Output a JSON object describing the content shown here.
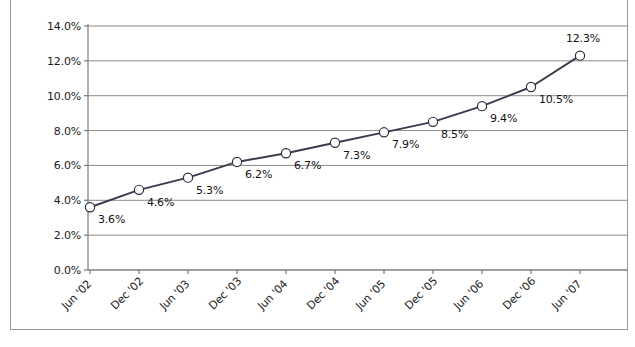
{
  "chart_data": {
    "type": "line",
    "title": "",
    "subtitle": "",
    "xlabel": "",
    "ylabel": "",
    "grid": true,
    "legend": "none",
    "ylim": [
      0.0,
      14.0
    ],
    "ytick_format": "percent",
    "yticks": [
      "0.0%",
      "2.0%",
      "4.0%",
      "6.0%",
      "8.0%",
      "10.0%",
      "12.0%",
      "14.0%"
    ],
    "ytick_values": [
      0.0,
      2.0,
      4.0,
      6.0,
      8.0,
      10.0,
      12.0,
      14.0
    ],
    "categories": [
      "Jun '02",
      "Dec '02",
      "Jun '03",
      "Dec '03",
      "Jun '04",
      "Dec '04",
      "Jun '05",
      "Dec '05",
      "Jun '06",
      "Dec '06",
      "Jun '07"
    ],
    "values": [
      3.6,
      4.6,
      5.3,
      6.2,
      6.7,
      7.3,
      7.9,
      8.5,
      9.4,
      10.5,
      12.3
    ],
    "point_labels": [
      "3.6%",
      "4.6%",
      "5.3%",
      "6.2%",
      "6.7%",
      "7.3%",
      "7.9%",
      "8.5%",
      "9.4%",
      "10.5%",
      "12.3%"
    ],
    "series": [
      {
        "name": "",
        "values": [
          3.6,
          4.6,
          5.3,
          6.2,
          6.7,
          7.3,
          7.9,
          8.5,
          9.4,
          10.5,
          12.3
        ]
      }
    ]
  },
  "style": {
    "line_color": "#3b3b4d",
    "marker_fill": "#ffffff",
    "marker_stroke": "#2f2f3d",
    "grid_color": "#8a8a8a",
    "axis_color": "#7a7a7a",
    "frame_color": "#9a9a9a",
    "text_color": "#1c1c1c",
    "background": "#ffffff"
  },
  "geometry": {
    "plot_left": 88,
    "plot_right": 620,
    "plot_top": 26,
    "plot_bottom": 270,
    "tick_step_x": 49,
    "label_offsets": [
      {
        "dx": 8,
        "dy": 12
      },
      {
        "dx": 8,
        "dy": 12
      },
      {
        "dx": 8,
        "dy": 12
      },
      {
        "dx": 8,
        "dy": 12
      },
      {
        "dx": 8,
        "dy": 12
      },
      {
        "dx": 8,
        "dy": 12
      },
      {
        "dx": 8,
        "dy": 12
      },
      {
        "dx": 8,
        "dy": 12
      },
      {
        "dx": 8,
        "dy": 12
      },
      {
        "dx": 8,
        "dy": 12
      },
      {
        "dx": -14,
        "dy": -18
      }
    ]
  }
}
